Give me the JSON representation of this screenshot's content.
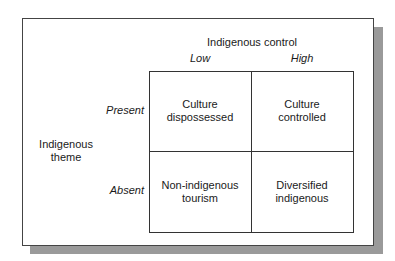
{
  "diagram": {
    "column_axis": {
      "title": "Indigenous control",
      "levels": [
        "Low",
        "High"
      ]
    },
    "row_axis": {
      "title_line1": "Indigenous",
      "title_line2": "theme",
      "levels": [
        "Present",
        "Absent"
      ]
    },
    "cells": [
      {
        "line1": "Culture",
        "line2": "dispossessed"
      },
      {
        "line1": "Culture",
        "line2": "controlled"
      },
      {
        "line1": "Non-indigenous",
        "line2": "tourism"
      },
      {
        "line1": "Diversified",
        "line2": "indigenous"
      }
    ]
  }
}
